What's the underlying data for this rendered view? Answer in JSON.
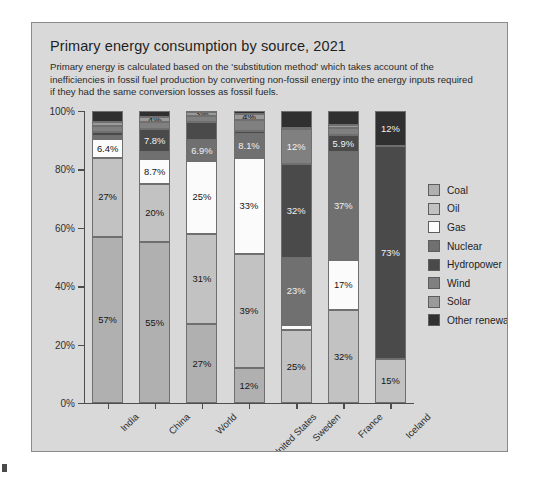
{
  "header": {
    "title": "Primary energy consumption by source, 2021",
    "subtitle": "Primary energy is calculated based on the 'substitution method' which takes account of the inefficiencies in fossil fuel production by converting non-fossil energy into the energy inputs required if they had the same conversion losses as fossil fuels."
  },
  "chart_data": {
    "type": "bar",
    "subtype": "stacked-percentage",
    "title": "Primary energy consumption by source, 2021",
    "subtitle": "Primary energy is calculated based on the 'substitution method' which takes account of the inefficiencies in fossil fuel production by converting non-fossil energy into the energy inputs required if they had the same conversion losses as fossil fuels.",
    "xlabel": "",
    "ylabel": "",
    "ylim": [
      0,
      100
    ],
    "yticks": [
      "0%",
      "20%",
      "40%",
      "60%",
      "80%",
      "100%"
    ],
    "ytick_values": [
      0,
      20,
      40,
      60,
      80,
      100
    ],
    "grid": false,
    "legend_position": "right",
    "categories": [
      "India",
      "China",
      "World",
      "United States",
      "Sweden",
      "France",
      "Iceland"
    ],
    "series": [
      {
        "name": "Coal",
        "color": "#b0b0b0",
        "values": [
          57,
          55,
          27,
          12,
          0,
          0,
          0
        ],
        "labels": [
          "57%",
          "55%",
          "27%",
          "12%",
          "",
          "",
          ""
        ]
      },
      {
        "name": "Oil",
        "color": "#c2c2c2",
        "values": [
          27,
          20,
          31,
          39,
          25,
          32,
          15
        ],
        "labels": [
          "27%",
          "20%",
          "31%",
          "39%",
          "25%",
          "32%",
          "15%"
        ]
      },
      {
        "name": "Gas",
        "color": "#fbfbfb",
        "values": [
          6.4,
          8.7,
          25,
          33,
          1.8,
          17,
          0
        ],
        "labels": [
          "6.4%",
          "8.7%",
          "25%",
          "33%",
          "",
          "17%",
          ""
        ]
      },
      {
        "name": "Nuclear",
        "color": "#707070",
        "values": [
          1.1,
          2.3,
          6.9,
          8.1,
          23,
          37,
          0
        ],
        "labels": [
          "",
          "",
          "6.9%",
          "8.1%",
          "23%",
          "37%",
          ""
        ]
      },
      {
        "name": "Hydropower",
        "color": "#4a4a4a",
        "values": [
          1.4,
          7.8,
          6.3,
          1.2,
          32,
          5.9,
          73
        ],
        "labels": [
          "",
          "7.8%",
          "",
          "",
          "32%",
          "5.9%",
          "73%"
        ]
      },
      {
        "name": "Wind",
        "color": "#808080",
        "values": [
          1.9,
          2.4,
          2.2,
          3.6,
          12,
          2.3,
          0
        ],
        "labels": [
          "",
          "",
          "",
          "",
          "12%",
          "",
          ""
        ]
      },
      {
        "name": "Solar",
        "color": "#9a9a9a",
        "values": [
          1.6,
          1.6,
          1.5,
          2.2,
          0.3,
          1.0,
          0
        ],
        "labels": [
          "",
          "4%",
          "3%",
          "4%",
          "",
          "",
          ""
        ]
      },
      {
        "name": "Other renewables",
        "color": "#303030",
        "values": [
          3.6,
          2.2,
          0.1,
          0.9,
          5.9,
          4.8,
          12
        ],
        "labels": [
          "",
          "",
          "",
          "",
          "",
          "",
          "12%"
        ]
      }
    ]
  },
  "legend": {
    "items": [
      {
        "label": "Coal",
        "color": "#b0b0b0"
      },
      {
        "label": "Oil",
        "color": "#c2c2c2"
      },
      {
        "label": "Gas",
        "color": "#fbfbfb"
      },
      {
        "label": "Nuclear",
        "color": "#707070"
      },
      {
        "label": "Hydropower",
        "color": "#4a4a4a"
      },
      {
        "label": "Wind",
        "color": "#808080"
      },
      {
        "label": "Solar",
        "color": "#9a9a9a"
      },
      {
        "label": "Other renewables",
        "color": "#303030"
      }
    ]
  }
}
